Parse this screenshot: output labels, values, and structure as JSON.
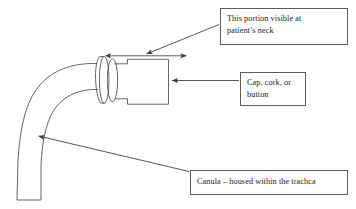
{
  "figure": {
    "type": "line-drawing",
    "background_color": "#ffffff",
    "line_color": "#4a4a4a",
    "text_color": "#1a1a1a",
    "box_border_color": "#5c5c5c",
    "parts": {
      "cannula": "curved tube",
      "flange": "concentric ellipse neck plate",
      "cap": "rectangular cap body with stepped neck"
    }
  },
  "labels": {
    "neck": {
      "name": "this-portion-visible-at-patients-neck",
      "line1": "This portion visible at",
      "line2": "patient’s neck"
    },
    "cap": {
      "name": "cap-cork-or-button",
      "line1": "Cap, cork, or",
      "line2": "button"
    },
    "canula": {
      "name": "canula-housed-within-the-trachca",
      "line1": "Canula – housed within the trachca"
    }
  },
  "annotations": {
    "span_arrow": {
      "name": "visible-portion-span-arrow",
      "style": "double-headed",
      "description": "horizontal span from flange to cap right edge"
    },
    "leader_neck": {
      "name": "neck-label-leader-arrow",
      "style": "single-headed",
      "description": "diagonal leader from neck label box to span arrow"
    },
    "leader_cap": {
      "name": "cap-label-leader-arrow",
      "style": "single-headed",
      "description": "horizontal leader from cap label box to cap body"
    },
    "leader_canula": {
      "name": "canula-label-leader-arrow",
      "style": "single-headed",
      "description": "diagonal leader from canula label box to curved tube"
    }
  }
}
